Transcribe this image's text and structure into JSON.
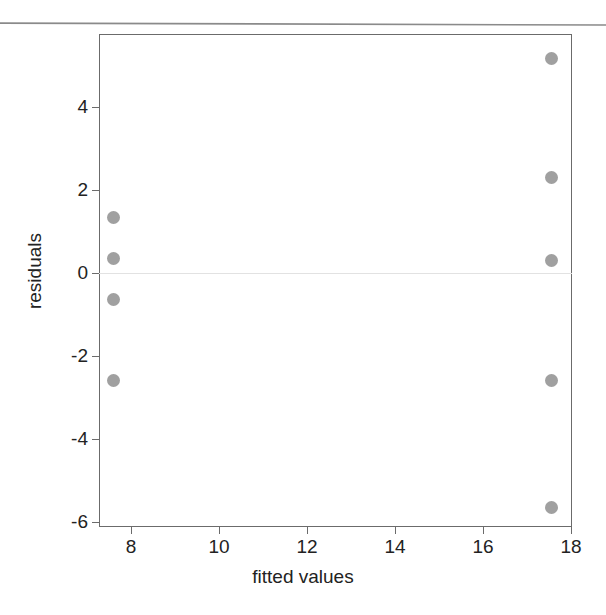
{
  "chart_data": {
    "type": "scatter",
    "title": "",
    "xlabel": "fitted values",
    "ylabel": "residuals",
    "xlim": [
      7.3,
      18.0
    ],
    "ylim": [
      -6.3,
      5.6
    ],
    "xticks": [
      "8",
      "10",
      "12",
      "14",
      "16",
      "18"
    ],
    "xtick_values": [
      8,
      10,
      12,
      14,
      16,
      18
    ],
    "yticks": [
      "4",
      "2",
      "0",
      "-2",
      "-4",
      "-6"
    ],
    "ytick_values": [
      4,
      2,
      0,
      -2,
      -4,
      -6
    ],
    "grid": false,
    "legend": null,
    "reference_line": {
      "orientation": "horizontal",
      "y": 0,
      "color": "#e2e2e2"
    },
    "marker": {
      "shape": "circle",
      "color": "#a0a0a0",
      "size_px": 13
    },
    "points": [
      {
        "x": 7.6,
        "y": 1.33
      },
      {
        "x": 7.6,
        "y": 0.36
      },
      {
        "x": 7.6,
        "y": -0.65
      },
      {
        "x": 7.6,
        "y": -2.6
      },
      {
        "x": 17.55,
        "y": 5.18
      },
      {
        "x": 17.55,
        "y": 2.29
      },
      {
        "x": 17.55,
        "y": 0.29
      },
      {
        "x": 17.55,
        "y": -2.6
      },
      {
        "x": 17.55,
        "y": -5.64
      }
    ],
    "series": [
      {
        "name": "residuals vs fitted",
        "x": [
          7.6,
          7.6,
          7.6,
          7.6,
          17.55,
          17.55,
          17.55,
          17.55,
          17.55
        ],
        "values": [
          1.33,
          0.36,
          -0.65,
          -2.6,
          5.18,
          2.29,
          0.29,
          -2.6,
          -5.64
        ]
      }
    ]
  },
  "artifacts": {
    "page_rule_color": "#8a8a8a"
  },
  "frame": {
    "border_color": "#6b6b6b"
  }
}
